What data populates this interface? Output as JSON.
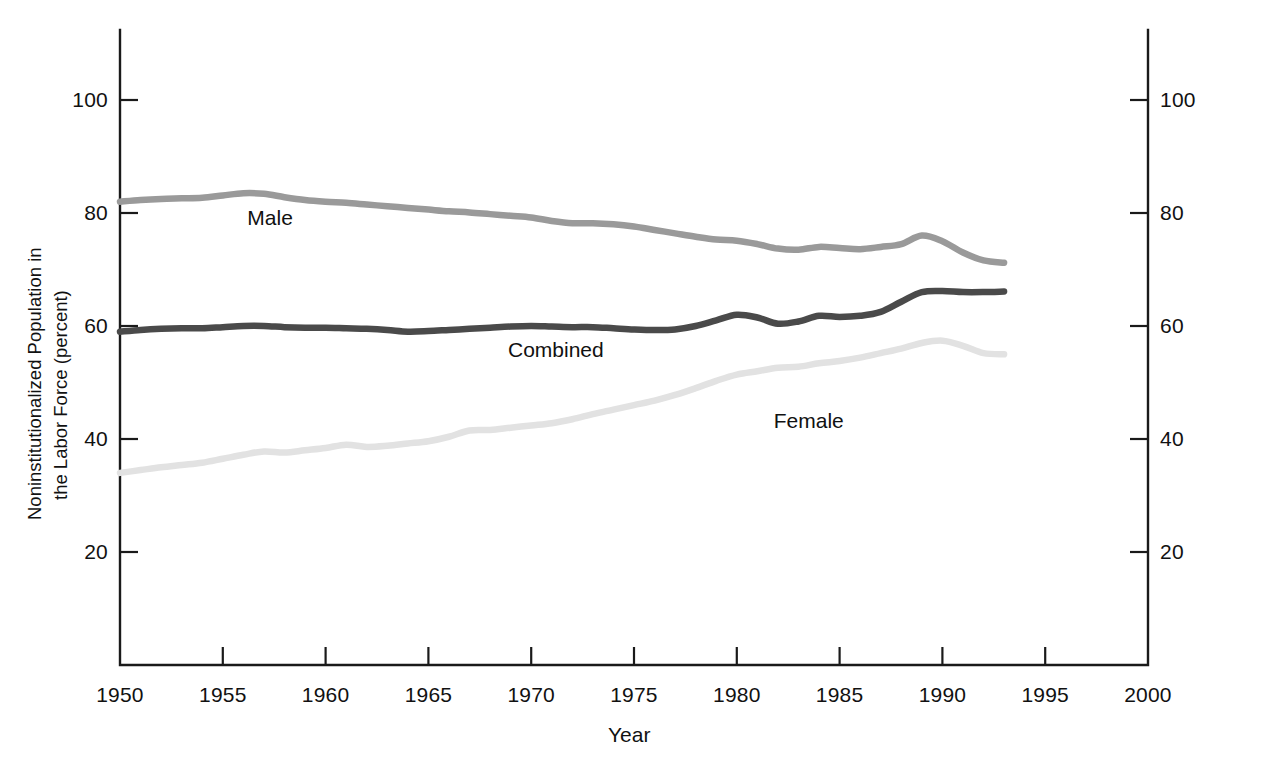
{
  "chart_data": {
    "type": "line",
    "title": "",
    "xlabel": "Year",
    "ylabel": "Noninstitutionalized Population in the Labor Force (percent)",
    "ylabel_line1": "Noninstitutionalized Population in",
    "ylabel_line2": "the Labor Force (percent)",
    "xlim": [
      1950,
      2000
    ],
    "ylim": [
      0,
      112
    ],
    "grid": false,
    "legend_position": "inline-labels",
    "xticks": [
      1950,
      1955,
      1960,
      1965,
      1970,
      1975,
      1980,
      1985,
      1990,
      1995,
      2000
    ],
    "xtick_labels": [
      "1950",
      "1955",
      "1960",
      "1965",
      "1970",
      "1975",
      "1980",
      "1985",
      "1990",
      "1995",
      "2000"
    ],
    "yticks": [
      20,
      40,
      60,
      80,
      100
    ],
    "ytick_labels": [
      "20",
      "40",
      "60",
      "80",
      "100"
    ],
    "right_axis_ticks": [
      20,
      40,
      60,
      80,
      100
    ],
    "right_axis_tick_labels": [
      "20",
      "40",
      "60",
      "80",
      "100"
    ],
    "x": [
      1950,
      1951,
      1952,
      1953,
      1954,
      1955,
      1956,
      1957,
      1958,
      1959,
      1960,
      1961,
      1962,
      1963,
      1964,
      1965,
      1966,
      1967,
      1968,
      1969,
      1970,
      1971,
      1972,
      1973,
      1974,
      1975,
      1976,
      1977,
      1978,
      1979,
      1980,
      1981,
      1982,
      1983,
      1984,
      1985,
      1986,
      1987,
      1988,
      1989,
      1990,
      1991,
      1992,
      1993
    ],
    "series": [
      {
        "name": "Male",
        "color": "#9a9a9a",
        "label": "Male",
        "values": [
          82.0,
          82.3,
          82.5,
          82.6,
          82.7,
          83.1,
          83.5,
          83.4,
          82.8,
          82.3,
          82.0,
          81.8,
          81.5,
          81.2,
          80.9,
          80.6,
          80.3,
          80.1,
          79.8,
          79.5,
          79.2,
          78.6,
          78.2,
          78.2,
          78.0,
          77.6,
          77.0,
          76.4,
          75.8,
          75.3,
          75.1,
          74.5,
          73.7,
          73.5,
          74.0,
          73.8,
          73.6,
          74.0,
          74.5,
          76.0,
          75.0,
          73.0,
          71.6,
          71.2
        ]
      },
      {
        "name": "Combined",
        "color": "#4a4a4a",
        "label": "Combined",
        "values": [
          59.0,
          59.3,
          59.5,
          59.6,
          59.6,
          59.8,
          60.0,
          60.0,
          59.8,
          59.7,
          59.7,
          59.6,
          59.5,
          59.3,
          59.0,
          59.1,
          59.3,
          59.5,
          59.7,
          59.9,
          60.0,
          59.9,
          59.8,
          59.8,
          59.6,
          59.4,
          59.3,
          59.4,
          60.0,
          61.0,
          62.0,
          61.5,
          60.4,
          60.8,
          61.8,
          61.6,
          61.8,
          62.5,
          64.3,
          66.0,
          66.2,
          66.0,
          66.0,
          66.1
        ]
      },
      {
        "name": "Female",
        "color": "#e2e2e2",
        "label": "Female",
        "values": [
          34.0,
          34.5,
          35.0,
          35.4,
          35.8,
          36.5,
          37.2,
          37.8,
          37.6,
          38.0,
          38.4,
          39.0,
          38.6,
          38.8,
          39.2,
          39.6,
          40.4,
          41.5,
          41.6,
          42.0,
          42.4,
          42.8,
          43.5,
          44.4,
          45.2,
          46.0,
          46.8,
          47.8,
          49.0,
          50.3,
          51.4,
          52.0,
          52.6,
          52.8,
          53.4,
          53.8,
          54.4,
          55.2,
          56.0,
          57.0,
          57.4,
          56.5,
          55.2,
          55.0
        ]
      }
    ]
  },
  "series_label_positions": [
    {
      "name": "Male",
      "x": 1957.3,
      "y": 79.0
    },
    {
      "name": "Combined",
      "x": 1971.2,
      "y": 55.5
    },
    {
      "name": "Female",
      "x": 1983.5,
      "y": 43.0
    }
  ]
}
